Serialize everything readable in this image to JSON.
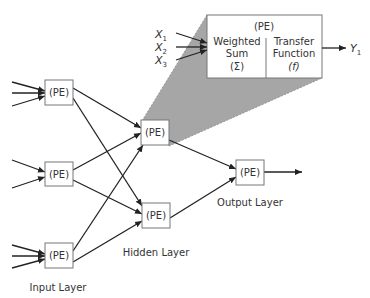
{
  "diagram": {
    "colors": {
      "line": "#222222",
      "box_stroke": "#777777",
      "shade": "#a6a6a6",
      "text": "#333333"
    },
    "node_label": "(PE)",
    "layers": {
      "input": {
        "label": "Input Layer",
        "nodes": 3,
        "incoming_arrows": [
          3,
          2,
          3
        ]
      },
      "hidden": {
        "label": "Hidden Layer",
        "nodes": 2
      },
      "output": {
        "label": "Output Layer",
        "nodes": 1
      }
    },
    "detail": {
      "title": "(PE)",
      "left_line1": "Weighted",
      "left_line2": "Sum",
      "left_line3": "(Σ)",
      "right_line1": "Transfer",
      "right_line2": "Function",
      "right_line3": "(f)",
      "inputs": [
        {
          "base": "X",
          "sub": "1"
        },
        {
          "base": "X",
          "sub": "2"
        },
        {
          "base": "X",
          "sub": "3"
        }
      ],
      "output": {
        "base": "Y",
        "sub": "1"
      }
    }
  }
}
